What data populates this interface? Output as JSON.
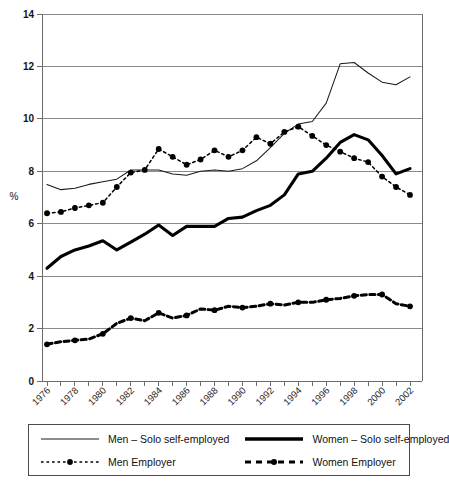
{
  "page": {
    "top_partial_text": "",
    "y_axis_title": "%"
  },
  "legend": {
    "items": [
      {
        "id": "men-solo",
        "label": "Men – Solo self-employed",
        "style": "thin-solid"
      },
      {
        "id": "women-solo",
        "label": "Women – Solo self-employed",
        "style": "thick-solid"
      },
      {
        "id": "men-emp",
        "label": "Men Employer",
        "style": "dotted-marker"
      },
      {
        "id": "women-emp",
        "label": "Women Employer",
        "style": "dashed-thick-marker"
      }
    ]
  },
  "chart_data": {
    "type": "line",
    "title": "",
    "xlabel": "",
    "ylabel": "%",
    "ylim": [
      0,
      14
    ],
    "ytick_values": [
      0,
      2,
      4,
      6,
      8,
      10,
      12,
      14
    ],
    "grid": true,
    "legend_position": "bottom",
    "x": [
      1976,
      1977,
      1978,
      1979,
      1980,
      1981,
      1982,
      1983,
      1984,
      1985,
      1986,
      1987,
      1988,
      1989,
      1990,
      1991,
      1992,
      1993,
      1994,
      1995,
      1996,
      1997,
      1998,
      1999,
      2000,
      2001,
      2002
    ],
    "xtick_labels": [
      "1976",
      "",
      "1978",
      "",
      "1980",
      "",
      "1982",
      "",
      "1984",
      "",
      "1986",
      "",
      "1988",
      "",
      "1990",
      "",
      "1992",
      "",
      "1994",
      "",
      "1996",
      "",
      "1998",
      "",
      "2000",
      "",
      "2002"
    ],
    "series": [
      {
        "name": "Men – Solo self-employed",
        "id": "men-solo",
        "markers": false,
        "values": [
          7.5,
          7.3,
          7.35,
          7.5,
          7.6,
          7.7,
          8.05,
          8.05,
          8.05,
          7.9,
          7.85,
          8.0,
          8.05,
          8.0,
          8.1,
          8.4,
          8.9,
          9.45,
          9.8,
          9.9,
          10.6,
          12.1,
          12.15,
          11.75,
          11.4,
          11.3,
          11.6
        ]
      },
      {
        "name": "Women – Solo self-employed",
        "id": "women-solo",
        "markers": false,
        "values": [
          4.3,
          4.75,
          5.0,
          5.15,
          5.35,
          5.0,
          5.3,
          5.6,
          5.95,
          5.55,
          5.9,
          5.9,
          5.9,
          6.2,
          6.25,
          6.5,
          6.7,
          7.1,
          7.9,
          8.0,
          8.5,
          9.1,
          9.4,
          9.2,
          8.6,
          7.9,
          8.1
        ]
      },
      {
        "name": "Men Employer",
        "id": "men-emp",
        "markers": true,
        "values": [
          6.4,
          6.45,
          6.6,
          6.7,
          6.8,
          7.4,
          7.95,
          8.05,
          8.85,
          8.55,
          8.25,
          8.45,
          8.8,
          8.55,
          8.8,
          9.3,
          9.05,
          9.5,
          9.7,
          9.35,
          9.0,
          8.75,
          8.5,
          8.35,
          7.8,
          7.4,
          7.1
        ]
      },
      {
        "name": "Women Employer",
        "id": "women-emp",
        "markers": true,
        "values": [
          1.4,
          1.5,
          1.55,
          1.6,
          1.8,
          2.2,
          2.4,
          2.3,
          2.6,
          2.4,
          2.5,
          2.75,
          2.7,
          2.85,
          2.8,
          2.85,
          2.95,
          2.9,
          3.0,
          3.0,
          3.1,
          3.15,
          3.25,
          3.3,
          3.3,
          2.95,
          2.85
        ]
      }
    ]
  }
}
